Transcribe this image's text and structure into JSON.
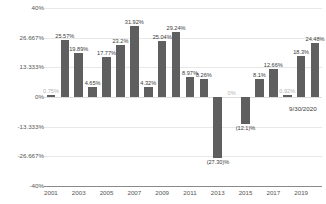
{
  "chart_data": {
    "type": "bar",
    "title": "",
    "xlabel": "",
    "ylabel": "",
    "ylim": [
      -40,
      40
    ],
    "grid": true,
    "legend": "none",
    "bar_color": "#5f5f5f",
    "yticks": [
      "40%",
      "26.667%",
      "13.333%",
      "0%",
      "-13.333%",
      "-26.667%",
      "-40%"
    ],
    "ytick_values": [
      40,
      26.667,
      13.333,
      0,
      -13.333,
      -26.667,
      -40
    ],
    "xticks": [
      "2001",
      "2003",
      "2005",
      "2007",
      "2009",
      "2011",
      "2013",
      "2015",
      "2017",
      "2019"
    ],
    "xtick_values": [
      2001,
      2003,
      2005,
      2007,
      2009,
      2011,
      2013,
      2015,
      2017,
      2019
    ],
    "categories": [
      2001,
      2002,
      2003,
      2004,
      2005,
      2006,
      2007,
      2008,
      2009,
      2010,
      2011,
      2012,
      2013,
      2014,
      2015,
      2016,
      2017,
      2018,
      2019,
      2020
    ],
    "values": [
      0.75,
      25.57,
      19.89,
      4.65,
      17.77,
      23.2,
      31.92,
      4.32,
      25.04,
      29.24,
      8.97,
      8.26,
      -27.3,
      0,
      -12.1,
      8.1,
      12.66,
      0.92,
      18.3,
      24.48
    ],
    "labels": [
      "0.75%",
      "25.57%",
      "19.89%",
      "4.65%",
      "17.77%",
      "23.2%",
      "31.92%",
      "4.32%",
      "25.04%",
      "29.24%",
      "8.97%",
      "8.26%",
      "(27.30)%",
      "0%",
      "(12.1)%",
      "8.1%",
      "12.66%",
      "0.92%",
      "18.3%",
      "24.48%"
    ],
    "annotations": [
      {
        "text": "9/30/2020",
        "category": 2020
      }
    ]
  }
}
